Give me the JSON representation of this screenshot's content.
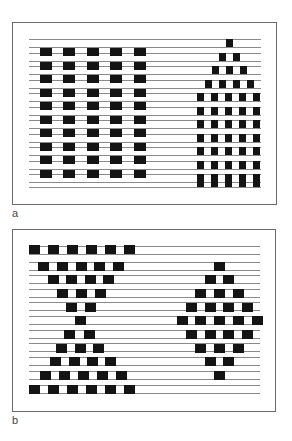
{
  "figure": {
    "panels": [
      {
        "id": "a",
        "label": "a",
        "frame": {
          "x": 12,
          "y": 22,
          "w": 265,
          "h": 183
        },
        "lines": {
          "x1": 29,
          "x2": 261,
          "ys": [
            39,
            47,
            53,
            61,
            66,
            74,
            80,
            88,
            93,
            101,
            107,
            115,
            120,
            128,
            134,
            142,
            147,
            155,
            161,
            169,
            174,
            182,
            187
          ]
        },
        "block_groups": [
          {
            "name": "left-checker-block",
            "w": 12,
            "h": 8,
            "rows": [
              {
                "y": 48,
                "xs": [
                  40,
                  63,
                  87,
                  110,
                  134
                ]
              },
              {
                "y": 62,
                "xs": [
                  40,
                  63,
                  87,
                  110,
                  134
                ]
              },
              {
                "y": 75,
                "xs": [
                  40,
                  63,
                  87,
                  110,
                  134
                ]
              },
              {
                "y": 89,
                "xs": [
                  40,
                  63,
                  87,
                  110,
                  134
                ]
              },
              {
                "y": 102,
                "xs": [
                  40,
                  63,
                  87,
                  110,
                  134
                ]
              },
              {
                "y": 116,
                "xs": [
                  40,
                  63,
                  87,
                  110,
                  134
                ]
              },
              {
                "y": 129,
                "xs": [
                  40,
                  63,
                  87,
                  110,
                  134
                ]
              },
              {
                "y": 143,
                "xs": [
                  40,
                  63,
                  87,
                  110,
                  134
                ]
              },
              {
                "y": 156,
                "xs": [
                  40,
                  63,
                  87,
                  110,
                  134
                ]
              },
              {
                "y": 170,
                "xs": [
                  40,
                  63,
                  87,
                  110,
                  134
                ]
              }
            ]
          },
          {
            "name": "right-pyramid-block",
            "w": 7,
            "h": 8,
            "rows": [
              {
                "y": 39,
                "xs": [
                  226
                ]
              },
              {
                "y": 53,
                "xs": [
                  219,
                  233
                ]
              },
              {
                "y": 66,
                "xs": [
                  212,
                  226,
                  240
                ]
              },
              {
                "y": 80,
                "xs": [
                  205,
                  219,
                  233,
                  247
                ]
              },
              {
                "y": 93,
                "xs": [
                  197,
                  211,
                  225,
                  239,
                  253
                ]
              },
              {
                "y": 107,
                "xs": [
                  197,
                  211,
                  225,
                  239,
                  253
                ]
              },
              {
                "y": 120,
                "xs": [
                  197,
                  211,
                  225,
                  239,
                  253
                ]
              },
              {
                "y": 134,
                "xs": [
                  197,
                  211,
                  225,
                  239,
                  253
                ]
              },
              {
                "y": 147,
                "xs": [
                  197,
                  211,
                  225,
                  239,
                  253
                ]
              },
              {
                "y": 161,
                "xs": [
                  197,
                  211,
                  225,
                  239,
                  253
                ]
              },
              {
                "y": 174,
                "xs": [
                  197,
                  211,
                  225,
                  239,
                  253
                ]
              },
              {
                "y": 179,
                "xs": [
                  197,
                  211,
                  225,
                  239,
                  253
                ]
              }
            ]
          }
        ],
        "label_pos": {
          "x": 12,
          "y": 208
        }
      },
      {
        "id": "b",
        "label": "b",
        "frame": {
          "x": 12,
          "y": 229,
          "w": 264,
          "h": 183
        },
        "lines": {
          "x1": 29,
          "x2": 260,
          "ys": [
            246,
            254,
            262,
            270,
            275,
            283,
            289,
            297,
            302,
            310,
            316,
            324,
            330,
            338,
            343,
            351,
            357,
            365,
            371,
            379,
            385,
            393
          ]
        },
        "block_groups": [
          {
            "name": "left-hourglass-block",
            "w": 11,
            "h": 9,
            "rows": [
              {
                "y": 245,
                "xs": [
                  29,
                  48,
                  67,
                  86,
                  105,
                  124
                ]
              },
              {
                "y": 262,
                "xs": [
                  38,
                  57,
                  76,
                  94,
                  113
                ]
              },
              {
                "y": 275,
                "xs": [
                  48,
                  66,
                  85,
                  103
                ]
              },
              {
                "y": 289,
                "xs": [
                  57,
                  76,
                  95
                ]
              },
              {
                "y": 303,
                "xs": [
                  66,
                  85
                ]
              },
              {
                "y": 316,
                "xs": [
                  75
                ]
              },
              {
                "y": 330,
                "xs": [
                  64,
                  84
                ]
              },
              {
                "y": 344,
                "xs": [
                  56,
                  75,
                  93
                ]
              },
              {
                "y": 357,
                "xs": [
                  50,
                  69,
                  87,
                  105
                ]
              },
              {
                "y": 371,
                "xs": [
                  40,
                  59,
                  78,
                  97,
                  116
                ]
              },
              {
                "y": 385,
                "xs": [
                  29,
                  48,
                  67,
                  86,
                  105,
                  124
                ]
              }
            ]
          },
          {
            "name": "right-diamond-block",
            "w": 11,
            "h": 9,
            "rows": [
              {
                "y": 262,
                "xs": [
                  214
                ]
              },
              {
                "y": 275,
                "xs": [
                  205,
                  223
                ]
              },
              {
                "y": 289,
                "xs": [
                  195,
                  214,
                  233
                ]
              },
              {
                "y": 303,
                "xs": [
                  186,
                  205,
                  223,
                  242
                ]
              },
              {
                "y": 316,
                "xs": [
                  177,
                  195,
                  214,
                  233,
                  252
                ]
              },
              {
                "y": 330,
                "xs": [
                  186,
                  205,
                  223,
                  242
                ]
              },
              {
                "y": 344,
                "xs": [
                  195,
                  214,
                  233
                ]
              },
              {
                "y": 357,
                "xs": [
                  205,
                  223
                ]
              },
              {
                "y": 371,
                "xs": [
                  214
                ]
              }
            ]
          }
        ],
        "label_pos": {
          "x": 12,
          "y": 415
        }
      }
    ],
    "colors": {
      "block": "#141414",
      "line": "#8a8a8a",
      "frame": "#6a6a6a",
      "label": "#444444"
    }
  }
}
